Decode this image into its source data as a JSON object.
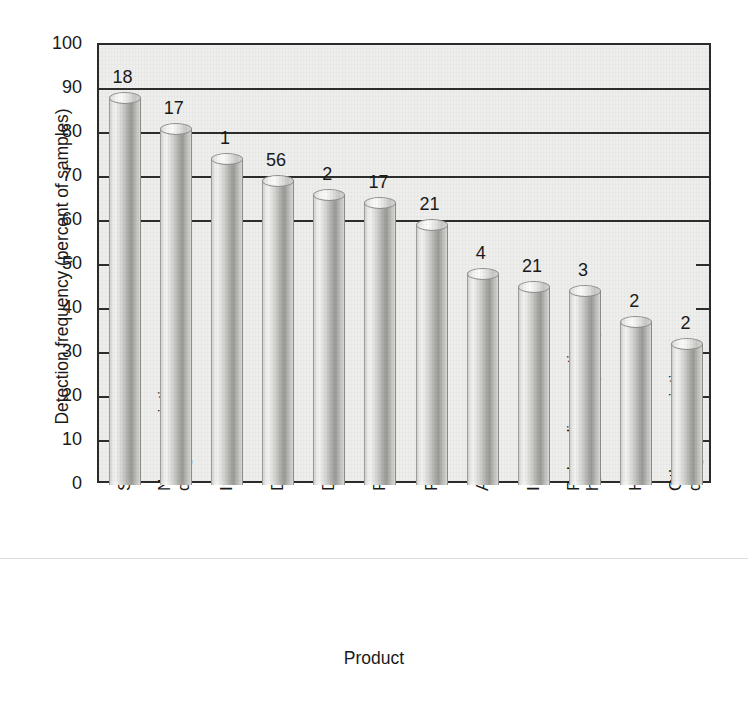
{
  "chart_data": {
    "type": "bar",
    "title": "",
    "xlabel": "Product",
    "ylabel": "Detection frequency (percent of samples)",
    "ylim": [
      0,
      100
    ],
    "yticks": [
      0,
      10,
      20,
      30,
      40,
      50,
      60,
      70,
      80,
      90,
      100
    ],
    "ytick_labels": [
      "0",
      "10",
      "20",
      "30",
      "40",
      "50",
      "60",
      "70",
      "80",
      "90",
      "100"
    ],
    "grid": true,
    "legend": "none",
    "categories": [
      "Steroids",
      "Nonprescription drugs",
      "Insect repellent",
      "Detergent metabolites",
      "Disinfectants",
      "Plasticizers",
      "Fire retardants",
      "Antibiotics",
      "Insecticides",
      "Polycyclic aromatic hydrocarbons (PAHs)",
      "Hormones",
      "Other prescription drugs"
    ],
    "values": [
      88,
      81,
      74,
      69,
      66,
      64,
      59,
      48,
      45,
      44,
      37,
      32
    ],
    "bar_labels": [
      "18",
      "17",
      "1",
      "56",
      "2",
      "17",
      "21",
      "4",
      "21",
      "3",
      "2",
      "2"
    ],
    "annotation_note": "Number above each bar is the count of compounds in that product group."
  },
  "category_lines": [
    {
      "l1": "Steroids",
      "l2": ""
    },
    {
      "l1": "Nonprescription",
      "l2": "drugs"
    },
    {
      "l1": "Insect repellent",
      "l2": ""
    },
    {
      "l1": "Detergent metabolites",
      "l2": ""
    },
    {
      "l1": "Disinfectants",
      "l2": ""
    },
    {
      "l1": "Plasticizers",
      "l2": ""
    },
    {
      "l1": "Fire retardants",
      "l2": ""
    },
    {
      "l1": "Antibiotics",
      "l2": ""
    },
    {
      "l1": "Insecticides",
      "l2": ""
    },
    {
      "l1": "Polycyclic aromatic",
      "l2": "hydrocarbons (PAHs)"
    },
    {
      "l1": "Hormones",
      "l2": ""
    },
    {
      "l1": "Other prescription",
      "l2": "drugs"
    }
  ],
  "colors": {
    "plot_background": "#eeeeec",
    "axis": "#2b2b2b",
    "gridline": "#2e2e2e",
    "bar_light": "#f2f2f1",
    "bar_dark": "#9a9a97",
    "text": "#1a1a1a",
    "page_background": "#ffffff"
  }
}
